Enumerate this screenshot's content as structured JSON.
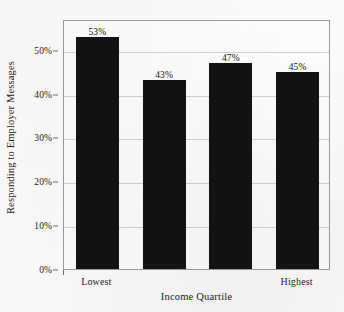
{
  "chart_data": {
    "type": "bar",
    "title": "",
    "categories": [
      "Lowest",
      "",
      "",
      "Highest"
    ],
    "values": [
      53,
      43,
      47,
      45
    ],
    "data_labels": [
      "53%",
      "43%",
      "47%",
      "45%"
    ],
    "xlabel": "Income Quartile",
    "ylabel": "Responding to Employer Messages",
    "ylim": [
      0,
      57
    ],
    "ytick_values": [
      0,
      10,
      20,
      30,
      40,
      50
    ],
    "ytick_labels": [
      "0%",
      "10%",
      "20%",
      "30%",
      "40%",
      "50%"
    ],
    "xtick_labels": [
      "Lowest",
      "Highest"
    ],
    "grid": true,
    "legend": false,
    "bar_color": "#131313",
    "frame_color": "#9a9a9a",
    "grid_color": "#cfcfcf",
    "background_color": "#fbfaf8"
  }
}
